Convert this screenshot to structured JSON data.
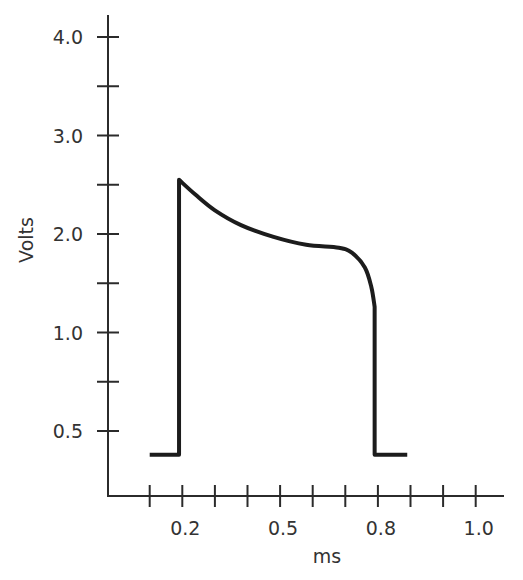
{
  "chart_data": {
    "type": "line",
    "title": "",
    "xlabel": "ms",
    "ylabel": "Volts",
    "grid": false,
    "legend": null,
    "xlim": [
      0.0,
      1.1
    ],
    "ylim": [
      0.0,
      4.0
    ],
    "x_ticks": {
      "count": 11,
      "labels": [
        {
          "tick": 1,
          "text": "0.2"
        },
        {
          "tick": 4,
          "text": "0.5"
        },
        {
          "tick": 7,
          "text": "0.8"
        },
        {
          "tick": 10,
          "text": "1.0"
        }
      ]
    },
    "y_ticks": {
      "count": 9,
      "labels": [
        {
          "tick": 0,
          "text": "4.0"
        },
        {
          "tick": 2,
          "text": "3.0"
        },
        {
          "tick": 4,
          "text": "2.0"
        },
        {
          "tick": 6,
          "text": "1.0"
        },
        {
          "tick": 8,
          "text": "0.5"
        }
      ]
    },
    "series": [
      {
        "name": "voltage",
        "x": [
          0.1,
          0.19,
          0.19,
          0.24,
          0.3,
          0.38,
          0.48,
          0.58,
          0.68,
          0.72,
          0.76,
          0.78,
          0.79,
          0.79,
          0.89
        ],
        "y": [
          0.38,
          0.38,
          2.55,
          2.4,
          2.24,
          2.09,
          1.97,
          1.89,
          1.86,
          1.81,
          1.66,
          1.46,
          1.26,
          0.38,
          0.38
        ]
      }
    ],
    "annotations": [],
    "colors": {
      "line": "#1c1c1c",
      "axis": "#2b2b2b",
      "text": "#333333",
      "background": "#ffffff"
    }
  }
}
